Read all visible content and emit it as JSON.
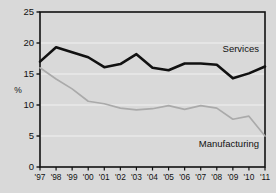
{
  "chart_data": {
    "type": "line",
    "title": "",
    "subtitle": "",
    "xlabel": "",
    "ylabel": "%",
    "ylim": [
      0,
      25
    ],
    "yticks": [
      0,
      5,
      10,
      15,
      20,
      25
    ],
    "grid": true,
    "legend_position": "inline-right",
    "categories": [
      "'97",
      "'98",
      "'99",
      "'00",
      "'01",
      "'02",
      "'03",
      "'04",
      "'05",
      "'06",
      "'07",
      "'08",
      "'09",
      "'10",
      "'11"
    ],
    "series": [
      {
        "name": "Services",
        "color": "#111111",
        "values": [
          17.0,
          19.3,
          18.5,
          17.7,
          16.1,
          16.6,
          18.2,
          16.0,
          15.6,
          16.7,
          16.7,
          16.5,
          14.3,
          15.1,
          16.2
        ]
      },
      {
        "name": "Manufacturing",
        "color": "#aaaaaa",
        "values": [
          16.0,
          14.2,
          12.6,
          10.6,
          10.2,
          9.5,
          9.2,
          9.4,
          9.9,
          9.3,
          9.9,
          9.5,
          7.7,
          8.2,
          5.0
        ]
      }
    ],
    "annotations": [
      {
        "text": "Services",
        "series": "Services"
      },
      {
        "text": "Manufacturing",
        "series": "Manufacturing"
      }
    ]
  },
  "style": {
    "background": "#d9d9d9",
    "plot_background": "#d9d9d9",
    "axis_color": "#111111",
    "grid_color": "#f2f2f2"
  },
  "y_tick_labels": [
    "0",
    "5",
    "10",
    "15",
    "20",
    "25"
  ]
}
